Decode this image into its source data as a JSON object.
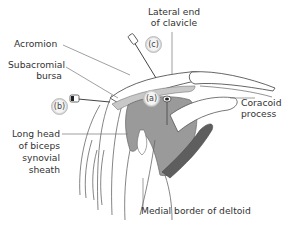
{
  "diagram": {
    "labels": {
      "acromion": "Acromion",
      "subacromial_bursa_line1": "Subacromial",
      "subacromial_bursa_line2": "bursa",
      "lateral_clavicle_line1": "Lateral end",
      "lateral_clavicle_line2": "of clavicle",
      "coracoid_line1": "Coracoid",
      "coracoid_line2": "process",
      "biceps_line1": "Long head",
      "biceps_line2": "of biceps",
      "biceps_line3": "synovial",
      "biceps_line4": "sheath",
      "deltoid": "Medial border of deltoid"
    },
    "markers": {
      "a": "(a)",
      "b": "(b)",
      "c": "(c)"
    },
    "colors": {
      "tissue_gray": "#9a9a9a",
      "dark_tendon": "#5e5e5e",
      "bursa_light": "#c8c8c8",
      "line": "#555555",
      "label_text": "#333333"
    }
  }
}
